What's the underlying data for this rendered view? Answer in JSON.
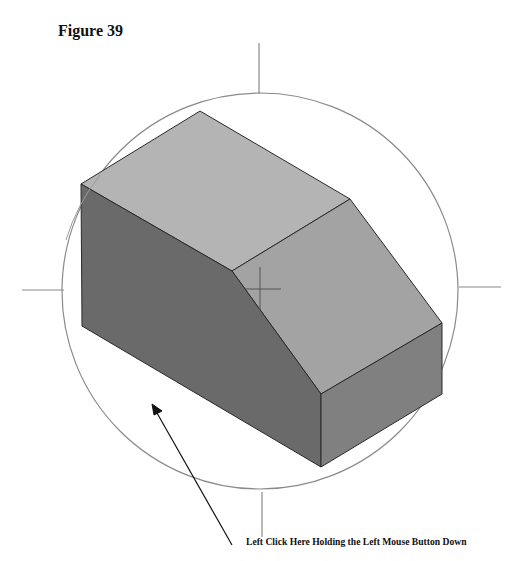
{
  "document": {
    "top_text_fragment": "",
    "figure_title": "Figure 39",
    "caption": "Left Click Here Holding the Left Mouse Button Down"
  },
  "figure": {
    "colors": {
      "top_face": "#b4b4b4",
      "slope_face": "#a3a3a3",
      "front_face": "#6a6a6a",
      "right_face": "#808080",
      "edge": "#2a2a2a",
      "circle": "#8a8a8a",
      "arrow": "#111111"
    },
    "circle": {
      "cx": 260,
      "cy": 290,
      "r": 198
    },
    "arrow": {
      "from": [
        232,
        545
      ],
      "to": [
        152,
        404
      ]
    }
  }
}
